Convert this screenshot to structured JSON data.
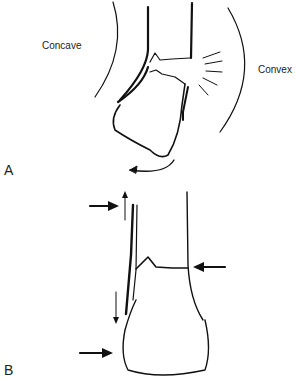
{
  "panel_a": {
    "letter": "A",
    "label_concave": "Concave",
    "label_convex": "Convex"
  },
  "panel_b": {
    "letter": "B"
  },
  "colors": {
    "line": "#111111",
    "background": "#ffffff"
  }
}
